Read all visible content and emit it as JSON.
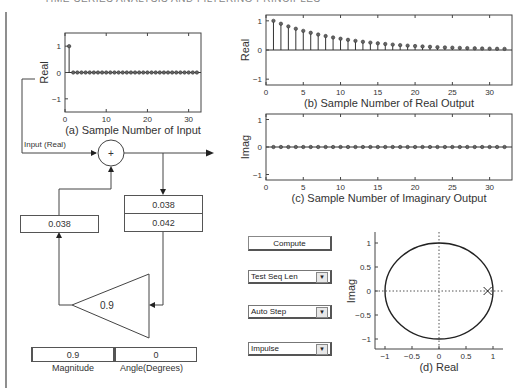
{
  "page_header": "TIME-SERIES ANALYSIS AND FILTERING PRINCIPLES",
  "plots": {
    "input": {
      "ylabel": "Real",
      "caption": "(a) Sample Number of Input",
      "xticks": [
        "0",
        "10",
        "20",
        "30"
      ],
      "yticks": [
        "1",
        "0",
        "−1"
      ],
      "xlim": [
        0,
        33
      ],
      "ylim": [
        -1.5,
        1.5
      ],
      "values": [
        1,
        0,
        0,
        0,
        0,
        0,
        0,
        0,
        0,
        0,
        0,
        0,
        0,
        0,
        0,
        0,
        0,
        0,
        0,
        0,
        0,
        0,
        0,
        0,
        0,
        0,
        0,
        0,
        0,
        0,
        0,
        0
      ]
    },
    "real_output": {
      "ylabel": "Real",
      "caption": "(b) Sample Number of Real Output",
      "xticks": [
        "0",
        "5",
        "10",
        "15",
        "20",
        "25",
        "30"
      ],
      "yticks": [
        "1",
        "0",
        "−1"
      ],
      "xlim": [
        0,
        33
      ],
      "ylim": [
        -1.2,
        1.2
      ],
      "values": [
        1.0,
        0.9,
        0.81,
        0.729,
        0.656,
        0.59,
        0.531,
        0.478,
        0.43,
        0.387,
        0.349,
        0.314,
        0.282,
        0.254,
        0.229,
        0.206,
        0.185,
        0.167,
        0.15,
        0.135,
        0.122,
        0.109,
        0.098,
        0.089,
        0.08,
        0.072,
        0.065,
        0.058,
        0.052,
        0.047,
        0.042,
        0.038
      ]
    },
    "imag_output": {
      "ylabel": "Imag",
      "caption": "(c) Sample Number of Imaginary Output",
      "xticks": [
        "0",
        "5",
        "10",
        "15",
        "20",
        "25",
        "30"
      ],
      "yticks": [
        "1",
        "0",
        "−1"
      ],
      "xlim": [
        0,
        33
      ],
      "ylim": [
        -1.2,
        1.2
      ],
      "values": [
        0,
        0,
        0,
        0,
        0,
        0,
        0,
        0,
        0,
        0,
        0,
        0,
        0,
        0,
        0,
        0,
        0,
        0,
        0,
        0,
        0,
        0,
        0,
        0,
        0,
        0,
        0,
        0,
        0,
        0,
        0,
        0
      ]
    },
    "pole_zero": {
      "ylabel": "Imag",
      "caption": "(d) Real",
      "xticks": [
        "−1",
        "−0.5",
        "0",
        "0.5",
        "1"
      ],
      "yticks": [
        "1",
        "0.5",
        "0",
        "−0.5",
        "−1"
      ],
      "xlim": [
        -1.2,
        1.2
      ],
      "ylim": [
        -1.2,
        1.2
      ],
      "poles": [
        {
          "re": 0.9,
          "im": 0
        }
      ]
    }
  },
  "chart_data": [
    {
      "type": "scatter",
      "title": "(a) Sample Number of Input",
      "ylabel": "Real",
      "x": [
        1,
        2,
        3,
        4,
        5,
        6,
        7,
        8,
        9,
        10,
        11,
        12,
        13,
        14,
        15,
        16,
        17,
        18,
        19,
        20,
        21,
        22,
        23,
        24,
        25,
        26,
        27,
        28,
        29,
        30,
        31,
        32
      ],
      "values": [
        1,
        0,
        0,
        0,
        0,
        0,
        0,
        0,
        0,
        0,
        0,
        0,
        0,
        0,
        0,
        0,
        0,
        0,
        0,
        0,
        0,
        0,
        0,
        0,
        0,
        0,
        0,
        0,
        0,
        0,
        0,
        0
      ],
      "ylim": [
        -1.5,
        1.5
      ]
    },
    {
      "type": "scatter",
      "title": "(b) Sample Number of Real Output",
      "ylabel": "Real",
      "values": [
        1.0,
        0.9,
        0.81,
        0.729,
        0.656,
        0.59,
        0.531,
        0.478,
        0.43,
        0.387,
        0.349,
        0.314,
        0.282,
        0.254,
        0.229,
        0.206,
        0.185,
        0.167,
        0.15,
        0.135,
        0.122,
        0.109,
        0.098,
        0.089,
        0.08,
        0.072,
        0.065,
        0.058,
        0.052,
        0.047,
        0.042,
        0.038
      ],
      "ylim": [
        -1.2,
        1.2
      ]
    },
    {
      "type": "scatter",
      "title": "(c) Sample Number of Imaginary Output",
      "ylabel": "Imag",
      "values": [
        0,
        0,
        0,
        0,
        0,
        0,
        0,
        0,
        0,
        0,
        0,
        0,
        0,
        0,
        0,
        0,
        0,
        0,
        0,
        0,
        0,
        0,
        0,
        0,
        0,
        0,
        0,
        0,
        0,
        0,
        0,
        0
      ],
      "ylim": [
        -1.2,
        1.2
      ]
    },
    {
      "type": "scatter",
      "title": "(d) Real",
      "ylabel": "Imag",
      "unit_circle": true,
      "poles": [
        [
          0.9,
          0
        ]
      ],
      "xlim": [
        -1.2,
        1.2
      ],
      "ylim": [
        -1.2,
        1.2
      ]
    }
  ],
  "diagram": {
    "input_label": "Input (Real)",
    "sum_symbol": "+",
    "delay_out_value": "0.038",
    "output_top_value": "0.038",
    "output_bottom_value": "0.042",
    "gain_value": "0.9"
  },
  "controls": {
    "magnitude_value": "0.9",
    "magnitude_label": "Magnitude",
    "angle_value": "0",
    "angle_label": "Angle(Degrees)",
    "compute_label": "Compute",
    "dropdown_seq_len": "Test Seq Len",
    "dropdown_step": "Auto Step",
    "dropdown_signal": "Impulse",
    "dropdown_arrow": "▼"
  }
}
